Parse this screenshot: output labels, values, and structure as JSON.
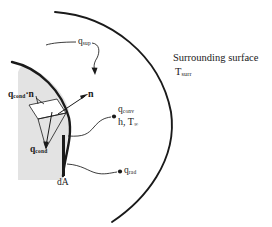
{
  "figure": {
    "type": "diagram",
    "background_color": "#ffffff",
    "line_color": "#1a1a1a",
    "shade_color": "#e2e2e2"
  },
  "labels": {
    "q_sup": {
      "base": "q",
      "sub": "sup"
    },
    "surrounding_surface": "Surrounding surface",
    "t_surr": {
      "base": "T",
      "sub": "surr"
    },
    "q_cond_dot_n": {
      "base": "q",
      "sub": "cond",
      "suffix": "·n"
    },
    "n_vector": "n",
    "q_cond": {
      "base": "q",
      "sub": "cond"
    },
    "q_conv": {
      "base": "q",
      "sub": "conv"
    },
    "h_Tinf": {
      "base": "h, T",
      "sub": "∞"
    },
    "q_rad": {
      "base": "q",
      "sub": "rad"
    },
    "dA": "dA"
  },
  "geometry": {
    "outer_arc": "large circular arc bulging right, from (55,12) through (172,115) to (112,222)",
    "body_surface_arc": "solid body surface arc from (12,62) through (70,120) to (63,175)",
    "shaded_body": "gray shaded control volume left of body surface",
    "surface_element_line": "thick vertical line x=63 from y=135 to y=175",
    "flux_wedge": "parallelogram and triangle showing conduction flux decomposition"
  }
}
